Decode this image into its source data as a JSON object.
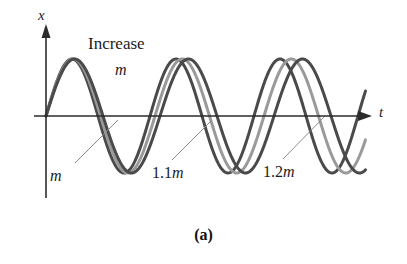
{
  "figure": {
    "caption": "(a)",
    "background": "#ffffff",
    "annotations": {
      "increase_word": "Increase",
      "increase_var": "m",
      "curve1_label": "m",
      "curve2_label_num": "1.1",
      "curve2_label_var": "m",
      "curve3_label_num": "1.2",
      "curve3_label_var": "m"
    }
  },
  "chart_data": {
    "type": "line",
    "title": "",
    "xlabel": "t",
    "ylabel": "x",
    "grid": false,
    "legend": "none",
    "axes": {
      "origin_px": [
        46,
        116
      ],
      "x_axis_end_px": [
        370,
        116
      ],
      "y_axis_top_px": [
        46,
        30
      ],
      "y_axis_bottom_px": [
        46,
        198
      ],
      "arrowheads": [
        "x-positive",
        "y-positive"
      ],
      "axis_color": "#2b2b2b",
      "axis_width_px": 1.6
    },
    "amplitude_px": 57,
    "amplitude": 1.0,
    "function": "x = A*sin(2*pi*t/T)",
    "note": "Period increases with mass: T proportional to sqrt(m)",
    "series": [
      {
        "name": "m",
        "label": "m",
        "mass_factor": 1.0,
        "period_px": 104,
        "color": "#4a4a4a",
        "width_px": 3.0,
        "amplitude": 1.0
      },
      {
        "name": "1.1m",
        "label": "1.1m",
        "mass_factor": 1.1,
        "period_px": 109,
        "color": "#9a9a9a",
        "width_px": 3.0,
        "amplitude": 1.0
      },
      {
        "name": "1.2m",
        "label": "1.2m",
        "mass_factor": 1.2,
        "period_px": 114,
        "color": "#4a4a4a",
        "width_px": 3.0,
        "amplitude": 1.0
      }
    ],
    "leaders": [
      {
        "name": "leader-m",
        "from_px": [
          75,
          163
        ],
        "to_px": [
          118,
          120
        ],
        "color": "#8c8c8c"
      },
      {
        "name": "leader-1.1m",
        "from_px": [
          172,
          160
        ],
        "to_px": [
          212,
          120
        ],
        "color": "#8c8c8c"
      },
      {
        "name": "leader-1.2m",
        "from_px": [
          283,
          159
        ],
        "to_px": [
          325,
          116
        ],
        "color": "#8c8c8c"
      }
    ]
  }
}
